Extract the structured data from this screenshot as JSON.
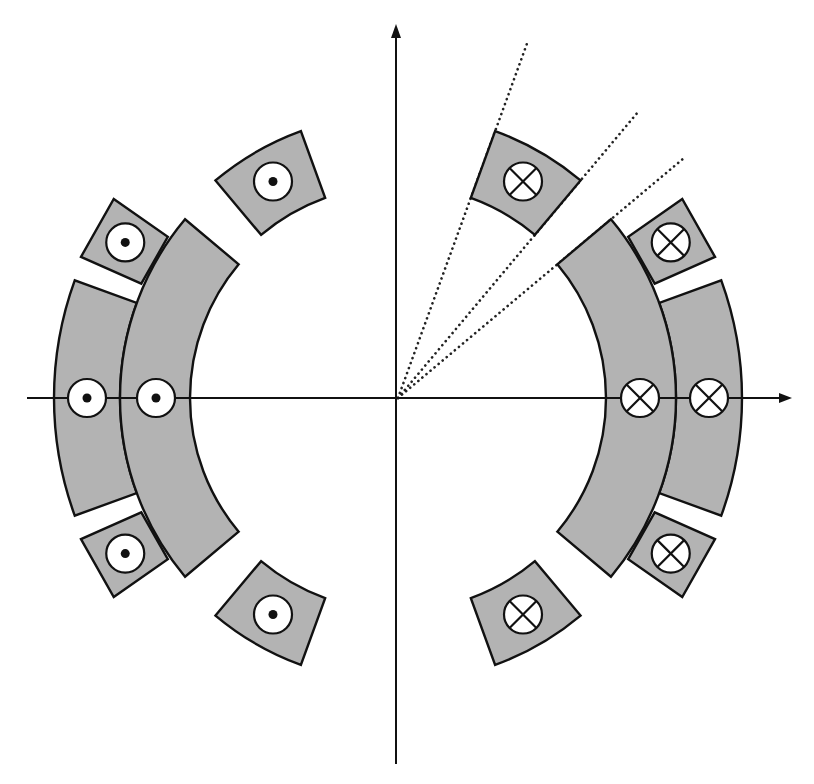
{
  "figure": {
    "width": 814,
    "height": 784,
    "colors": {
      "fill": "#b3b3b3",
      "stroke": "#111111",
      "background": "#ffffff"
    }
  },
  "axes": {
    "origin": [
      398,
      398
    ],
    "x_axis": {
      "from": [
        27,
        398
      ],
      "to": [
        792,
        398
      ],
      "arrow": "right"
    },
    "y_axis": {
      "from": [
        396,
        764
      ],
      "to": [
        396,
        24
      ],
      "arrow": "up"
    }
  },
  "guide_lines": [
    {
      "angle_deg": 70,
      "length": 378
    },
    {
      "angle_deg": 50,
      "length": 375
    },
    {
      "angle_deg": 40,
      "length": 372
    }
  ],
  "shells": [
    {
      "name": "inner-shell",
      "r_inner": 208,
      "r_outer": 278,
      "half_angle_deg": 40,
      "marker_r": 242
    },
    {
      "name": "outer-shell",
      "r_inner": 278,
      "r_outer": 344,
      "half_angle_deg": 20,
      "marker_r": 311
    }
  ],
  "blocks": [
    {
      "name": "mid-block",
      "r_inner": 281,
      "r_outer": 347,
      "angle_from_deg": 24,
      "angle_to_deg": 35,
      "straight": true,
      "marker_r": 314,
      "marker_angle_deg": 29.7
    },
    {
      "name": "far-block",
      "r_inner": 213,
      "r_outer": 284,
      "angle_from_deg": 50,
      "angle_to_deg": 70,
      "straight": false,
      "marker_r": 250,
      "marker_angle_deg": 60
    }
  ],
  "markers": {
    "radius": 19,
    "dot_radius": 4.5,
    "right_side": "cross",
    "left_side": "dot",
    "legend": {
      "cross": "current into page (⊗)",
      "dot": "current out of page (⊙)"
    }
  }
}
